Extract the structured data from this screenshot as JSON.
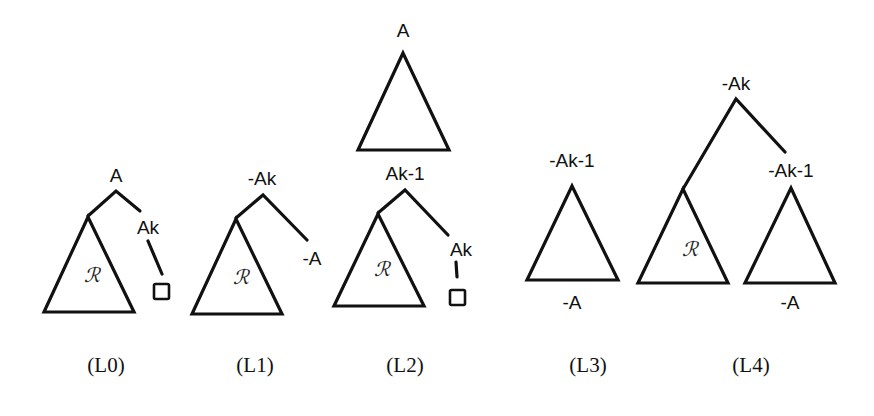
{
  "figure": {
    "panels": [
      {
        "id": "L0",
        "caption": "(L0)",
        "root_label": "A",
        "child_label": "Ak",
        "subtree_label": "ℛ",
        "leaf": "square"
      },
      {
        "id": "L1",
        "caption": "(L1)",
        "root_label": "-Ak",
        "child_label": "-A",
        "subtree_label": "ℛ"
      },
      {
        "id": "L2",
        "caption": "(L2)",
        "top_label": "A",
        "root_label": "Ak-1",
        "child_label": "Ak",
        "subtree_label": "ℛ",
        "leaf": "square"
      },
      {
        "id": "L3",
        "caption": "(L3)",
        "root_label": "-Ak-1",
        "bottom_label": "-A"
      },
      {
        "id": "L4",
        "caption": "(L4)",
        "root_label": "-Ak",
        "child_label": "-Ak-1",
        "subtree_label": "ℛ",
        "bottom_label": "-A"
      }
    ]
  },
  "colors": {
    "ink": "#111111",
    "background": "#ffffff"
  }
}
